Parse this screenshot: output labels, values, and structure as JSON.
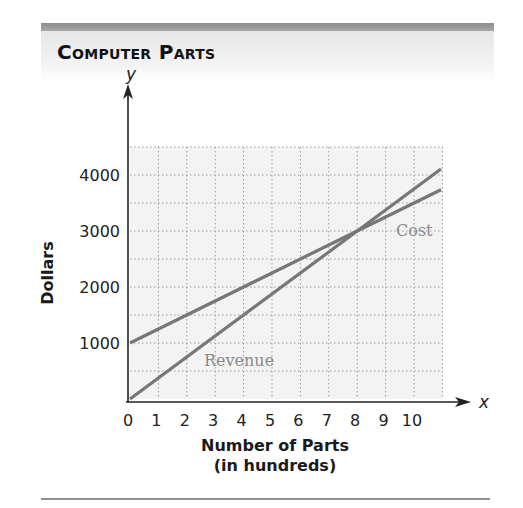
{
  "title": "Computer Parts",
  "axes": {
    "y_letter": "y",
    "x_letter": "x",
    "ylabel": "Dollars",
    "xlabel_line1": "Number of Parts",
    "xlabel_line2": "(in hundreds)"
  },
  "series_labels": {
    "cost": "Cost",
    "revenue": "Revenue"
  },
  "colors": {
    "line": "#777777",
    "series_label": "#8a8a8a",
    "grid_bg": "#f3f3f3",
    "grid_line": "#9a9a9a"
  },
  "chart_data": {
    "type": "line",
    "title": "Computer Parts",
    "xlabel": "Number of Parts (in hundreds)",
    "ylabel": "Dollars",
    "x_ticks": [
      0,
      1,
      2,
      3,
      4,
      5,
      6,
      7,
      8,
      9,
      10
    ],
    "y_ticks": [
      1000,
      2000,
      3000,
      4000
    ],
    "xlim": [
      0,
      11
    ],
    "ylim": [
      0,
      4500
    ],
    "grid": true,
    "grid_minor_y_step": 500,
    "series": [
      {
        "name": "Cost",
        "x": [
          0,
          8,
          11
        ],
        "values": [
          1000,
          3000,
          3750
        ]
      },
      {
        "name": "Revenue",
        "x": [
          0,
          8,
          11
        ],
        "values": [
          0,
          3000,
          4125
        ]
      }
    ],
    "annotations": [
      {
        "text": "Cost",
        "x": 10.3,
        "y": 3200
      },
      {
        "text": "Revenue",
        "x": 4.5,
        "y": 700
      },
      {
        "text": "Intersection (break-even)",
        "x": 8,
        "y": 3000
      }
    ],
    "legend": "inline labels"
  }
}
